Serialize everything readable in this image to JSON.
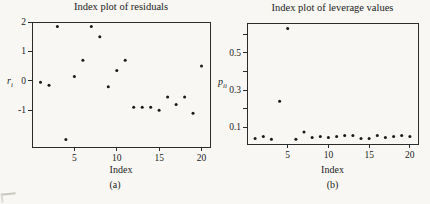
{
  "page": {
    "background": "#f8f7f3",
    "ink": "#1b1b1b",
    "frame_color": "#2b2b2b",
    "dot_color": "#1a1a1a"
  },
  "chart_data": [
    {
      "type": "scatter",
      "title": "Index plot of residuals",
      "xlabel": "Index",
      "ylabel_base": "r",
      "ylabel_sub": "i",
      "caption": "(a)",
      "x": [
        1,
        2,
        3,
        4,
        5,
        6,
        7,
        8,
        9,
        10,
        11,
        12,
        13,
        14,
        15,
        16,
        17,
        18,
        19,
        20
      ],
      "y": [
        -0.05,
        -0.15,
        1.85,
        -2.0,
        0.15,
        0.7,
        1.85,
        1.5,
        -0.2,
        0.35,
        0.7,
        -0.9,
        -0.9,
        -0.9,
        -1.0,
        -0.55,
        -0.8,
        -0.55,
        -1.1,
        0.5
      ],
      "xlim": [
        0,
        21
      ],
      "ylim": [
        -2.25,
        2.0
      ],
      "xticks": [
        5,
        10,
        15,
        20
      ],
      "xtick_labels": [
        "5",
        "10",
        "15",
        "20"
      ],
      "yticks": [
        2,
        1,
        0,
        -1
      ],
      "ytick_labels": [
        "2",
        "1",
        "0",
        "-1"
      ],
      "yticks_minor": [],
      "grid": false,
      "legend": "none"
    },
    {
      "type": "scatter",
      "title": "Index plot of leverage values",
      "xlabel": "Index",
      "ylabel_base": "p",
      "ylabel_sub": "ii",
      "caption": "(b)",
      "x": [
        1,
        2,
        3,
        4,
        5,
        6,
        7,
        8,
        9,
        10,
        11,
        12,
        13,
        14,
        15,
        16,
        17,
        18,
        19,
        20
      ],
      "y": [
        0.04,
        0.05,
        0.035,
        0.24,
        0.63,
        0.035,
        0.075,
        0.045,
        0.05,
        0.045,
        0.05,
        0.055,
        0.055,
        0.04,
        0.04,
        0.055,
        0.045,
        0.05,
        0.055,
        0.05
      ],
      "xlim": [
        0,
        21
      ],
      "ylim": [
        0.01,
        0.66
      ],
      "xticks": [
        5,
        10,
        15,
        20
      ],
      "xtick_labels": [
        "5",
        "10",
        "15",
        "20"
      ],
      "yticks": [
        0.1,
        0.3,
        0.5
      ],
      "ytick_labels": [
        "0.1",
        "0.3",
        "0.5"
      ],
      "yticks_minor": [
        0.2,
        0.4,
        0.6
      ],
      "grid": false,
      "legend": "none"
    }
  ]
}
